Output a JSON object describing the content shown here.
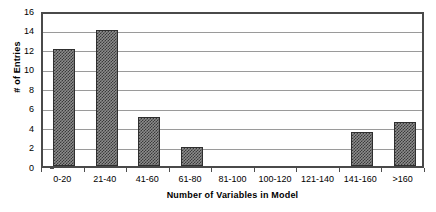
{
  "chart_data": {
    "type": "bar",
    "title": "",
    "xlabel": "Number of Variables in Model",
    "ylabel": "# of Entries",
    "categories": [
      "0-20",
      "21-40",
      "41-60",
      "61-80",
      "81-100",
      "100-120",
      "121-140",
      "141-160",
      ">160"
    ],
    "values": [
      12,
      14,
      5,
      2,
      0,
      0,
      0,
      3.5,
      4.5
    ],
    "ylim": [
      0,
      16
    ],
    "ytick_labels": [
      "0",
      "2",
      "4",
      "6",
      "8",
      "10",
      "12",
      "14",
      "16"
    ],
    "ytick_values": [
      0,
      2,
      4,
      6,
      8,
      10,
      12,
      14,
      16
    ],
    "grid": true,
    "legend": "none",
    "colors": {
      "bar_fill": "#8c8c8c",
      "bar_pattern": "#3a3a3a",
      "bar_border": "#2f2f2f",
      "gridline": "#9a9a9a",
      "axis": "#4a4a4a",
      "plot_background": "#ffffff",
      "text": "#000000"
    }
  }
}
